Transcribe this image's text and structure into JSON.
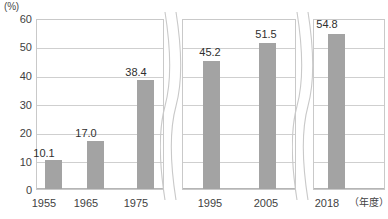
{
  "chart_data": {
    "type": "bar",
    "title": "",
    "xlabel": "（年度）",
    "ylabel": "(%)",
    "ylim": [
      0,
      60
    ],
    "yticks": [
      "0",
      "10",
      "20",
      "30",
      "40",
      "50",
      "60"
    ],
    "grid": true,
    "legend": "none",
    "axis_breaks": [
      {
        "after_category": "1975"
      },
      {
        "after_category": "2005"
      }
    ],
    "categories": [
      "1955",
      "1965",
      "1975",
      "1995",
      "2005",
      "2018"
    ],
    "values": [
      10.1,
      17.0,
      38.4,
      45.2,
      51.5,
      54.8
    ],
    "data_labels": [
      "10.1",
      "17.0",
      "38.4",
      "45.2",
      "51.5",
      "54.8"
    ],
    "panels": [
      {
        "categories": [
          "1955",
          "1965",
          "1975"
        ]
      },
      {
        "categories": [
          "1995",
          "2005"
        ]
      },
      {
        "categories": [
          "2018"
        ]
      }
    ]
  },
  "colors": {
    "bar": "#a3a3a3",
    "gridline": "#cfcfcf",
    "frame": "#c9c9c9",
    "text": "#3f3f3f",
    "background": "#ffffff"
  }
}
